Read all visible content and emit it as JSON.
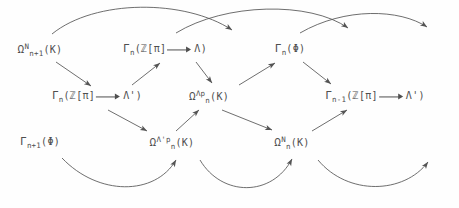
{
  "figure": {
    "type": "commutative-braid-diagram",
    "ink_color": "#4f4f4f",
    "background_color": "#fefefe",
    "width": 459,
    "height": 208
  },
  "nodes": [
    {
      "id": "omega-N-n1-K",
      "row": "top",
      "col": 1,
      "x": 40,
      "y": 50,
      "base": "Ω",
      "sub": "n+1",
      "sup": "N",
      "arg": "(K)",
      "plain": "Ω^N_{n+1}(K)"
    },
    {
      "id": "gamma-n-zpi-lambda",
      "row": "top",
      "col": 2,
      "x": 165,
      "y": 50,
      "base": "Γ",
      "sub": "n",
      "sup": "",
      "arg": "(ℤ[π] ⟶ Λ)",
      "plain": "Γ_n(ℤ[π] ⟶ Λ)",
      "arg_left": "(ℤ[π]",
      "arg_right": "Λ)",
      "has_inline_arrow": true
    },
    {
      "id": "gamma-n-phi",
      "row": "top",
      "col": 3,
      "x": 290,
      "y": 50,
      "base": "Γ",
      "sub": "n",
      "sup": "",
      "arg": "(Φ)",
      "plain": "Γ_n(Φ)"
    },
    {
      "id": "gamma-n-zpi-lambda-prime",
      "row": "middle",
      "col": 1,
      "x": 97,
      "y": 97,
      "base": "Γ",
      "sub": "n",
      "sup": "",
      "arg": "(ℤ[π] ⟶ Λ')",
      "plain": "Γ_n(ℤ[π] ⟶ Λ')",
      "arg_left": "(ℤ[π]",
      "arg_right": "Λ')",
      "has_inline_arrow": true
    },
    {
      "id": "omega-lambdap-n-K",
      "row": "middle",
      "col": 2,
      "x": 209,
      "y": 97,
      "base": "Ω",
      "sub": "n",
      "sup": "Λp",
      "arg": "(K)",
      "plain": "Ω_n^{Λp}(K)"
    },
    {
      "id": "gamma-n-1-zpi-lambda-prime",
      "row": "middle",
      "col": 3,
      "x": 375,
      "y": 97,
      "base": "Γ",
      "sub": "n-1",
      "sup": "",
      "arg": "(ℤ[π] ⟶ Λ')",
      "plain": "Γ_{n-1}(ℤ[π] ⟶ Λ')",
      "arg_left": "(ℤ[π]",
      "arg_right": "Λ')",
      "has_inline_arrow": true
    },
    {
      "id": "gamma-n1-phi",
      "row": "bottom",
      "col": 1,
      "x": 40,
      "y": 143,
      "base": "Γ",
      "sub": "n+1",
      "sup": "",
      "arg": "(Φ)",
      "plain": "Γ_{n+1}(Φ)"
    },
    {
      "id": "omega-lambda-prime-p-n-K",
      "row": "bottom",
      "col": 2,
      "x": 172,
      "y": 143,
      "base": "Ω",
      "sub": "n",
      "sup": "Λ'p",
      "arg": "(K)",
      "plain": "Ω_n^{Λ'p}(K)"
    },
    {
      "id": "omega-N-n-K",
      "row": "bottom",
      "col": 3,
      "x": 292,
      "y": 143,
      "base": "Ω",
      "sub": "n",
      "sup": "N",
      "arg": "(K)",
      "plain": "Ω_n^N(K)"
    }
  ],
  "edges": [
    {
      "id": "arc-top-1",
      "kind": "curve-over",
      "from": "omega-N-n1-K",
      "to": "gamma-n-phi"
    },
    {
      "id": "arc-top-2",
      "kind": "curve-over",
      "from": "gamma-n-zpi-lambda",
      "to": "gamma-n-1-zpi-lambda-prime"
    },
    {
      "id": "arc-top-3",
      "kind": "curve-over",
      "from": "gamma-n-phi",
      "to": "right-edge"
    },
    {
      "id": "diag-1",
      "kind": "straight",
      "from": "omega-N-n1-K",
      "to": "gamma-n-zpi-lambda-prime"
    },
    {
      "id": "diag-2",
      "kind": "straight",
      "from": "gamma-n-zpi-lambda-prime",
      "to": "gamma-n-zpi-lambda"
    },
    {
      "id": "diag-3",
      "kind": "straight",
      "from": "gamma-n-zpi-lambda",
      "to": "omega-lambdap-n-K"
    },
    {
      "id": "diag-4",
      "kind": "straight",
      "from": "omega-lambdap-n-K",
      "to": "gamma-n-phi"
    },
    {
      "id": "diag-5",
      "kind": "straight",
      "from": "gamma-n-phi",
      "to": "gamma-n-1-zpi-lambda-prime"
    },
    {
      "id": "diag-6",
      "kind": "straight",
      "from": "gamma-n-zpi-lambda-prime",
      "to": "omega-lambda-prime-p-n-K"
    },
    {
      "id": "diag-7",
      "kind": "straight",
      "from": "omega-lambda-prime-p-n-K",
      "to": "omega-lambdap-n-K"
    },
    {
      "id": "diag-8",
      "kind": "straight",
      "from": "omega-lambdap-n-K",
      "to": "omega-N-n-K"
    },
    {
      "id": "diag-9",
      "kind": "straight",
      "from": "omega-N-n-K",
      "to": "gamma-n-1-zpi-lambda-prime"
    },
    {
      "id": "arc-bot-1",
      "kind": "curve-under",
      "from": "gamma-n1-phi",
      "to": "omega-lambda-prime-p-n-K"
    },
    {
      "id": "arc-bot-2",
      "kind": "curve-under",
      "from": "omega-lambda-prime-p-n-K",
      "to": "omega-N-n-K"
    },
    {
      "id": "arc-bot-3",
      "kind": "curve-under",
      "from": "omega-N-n-K",
      "to": "gamma-n-1-zpi-lambda-prime"
    }
  ]
}
